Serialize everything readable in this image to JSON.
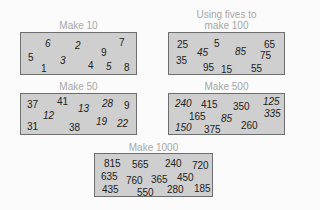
{
  "panels": [
    {
      "id": "make-10",
      "title": "Make 10",
      "numbers": [
        {
          "v": "6",
          "x": 24,
          "y": 5,
          "it": true
        },
        {
          "v": "2",
          "x": 54,
          "y": 7,
          "it": true
        },
        {
          "v": "7",
          "x": 98,
          "y": 4,
          "it": false
        },
        {
          "v": "5",
          "x": 7,
          "y": 19,
          "it": false
        },
        {
          "v": "9",
          "x": 80,
          "y": 14,
          "it": false
        },
        {
          "v": "3",
          "x": 39,
          "y": 22,
          "it": true
        },
        {
          "v": "1",
          "x": 20,
          "y": 30,
          "it": false
        },
        {
          "v": "4",
          "x": 67,
          "y": 27,
          "it": false
        },
        {
          "v": "5",
          "x": 85,
          "y": 28,
          "it": true
        },
        {
          "v": "8",
          "x": 103,
          "y": 29,
          "it": false
        }
      ]
    },
    {
      "id": "make-100",
      "title": "Using fives to make 100",
      "numbers": [
        {
          "v": "25",
          "x": 8,
          "y": 6,
          "it": false
        },
        {
          "v": "5",
          "x": 45,
          "y": 5,
          "it": false
        },
        {
          "v": "65",
          "x": 95,
          "y": 6,
          "it": false
        },
        {
          "v": "45",
          "x": 28,
          "y": 14,
          "it": true
        },
        {
          "v": "85",
          "x": 66,
          "y": 13,
          "it": true
        },
        {
          "v": "75",
          "x": 91,
          "y": 17,
          "it": false
        },
        {
          "v": "35",
          "x": 7,
          "y": 22,
          "it": false
        },
        {
          "v": "95",
          "x": 34,
          "y": 29,
          "it": false
        },
        {
          "v": "15",
          "x": 52,
          "y": 31,
          "it": false
        },
        {
          "v": "55",
          "x": 82,
          "y": 30,
          "it": false
        }
      ]
    },
    {
      "id": "make-50",
      "title": "Make 50",
      "numbers": [
        {
          "v": "37",
          "x": 6,
          "y": 5,
          "it": false
        },
        {
          "v": "41",
          "x": 36,
          "y": 2,
          "it": false
        },
        {
          "v": "13",
          "x": 57,
          "y": 9,
          "it": true
        },
        {
          "v": "28",
          "x": 81,
          "y": 4,
          "it": true
        },
        {
          "v": "9",
          "x": 103,
          "y": 6,
          "it": false
        },
        {
          "v": "12",
          "x": 22,
          "y": 16,
          "it": true
        },
        {
          "v": "19",
          "x": 75,
          "y": 22,
          "it": true
        },
        {
          "v": "22",
          "x": 96,
          "y": 24,
          "it": true
        },
        {
          "v": "31",
          "x": 6,
          "y": 27,
          "it": false
        },
        {
          "v": "38",
          "x": 48,
          "y": 28,
          "it": false
        }
      ]
    },
    {
      "id": "make-500",
      "title": "Make 500",
      "numbers": [
        {
          "v": "240",
          "x": 6,
          "y": 4,
          "it": true
        },
        {
          "v": "415",
          "x": 32,
          "y": 5,
          "it": false
        },
        {
          "v": "350",
          "x": 64,
          "y": 7,
          "it": false
        },
        {
          "v": "125",
          "x": 94,
          "y": 2,
          "it": true
        },
        {
          "v": "165",
          "x": 20,
          "y": 17,
          "it": false
        },
        {
          "v": "85",
          "x": 52,
          "y": 19,
          "it": true
        },
        {
          "v": "335",
          "x": 95,
          "y": 14,
          "it": true
        },
        {
          "v": "150",
          "x": 6,
          "y": 28,
          "it": true
        },
        {
          "v": "375",
          "x": 35,
          "y": 30,
          "it": false
        },
        {
          "v": "260",
          "x": 72,
          "y": 26,
          "it": false
        }
      ]
    },
    {
      "id": "make-1000",
      "title": "Make 1000",
      "numbers": [
        {
          "v": "815",
          "x": 9,
          "y": 4,
          "it": false
        },
        {
          "v": "565",
          "x": 37,
          "y": 5,
          "it": false
        },
        {
          "v": "240",
          "x": 70,
          "y": 4,
          "it": false
        },
        {
          "v": "720",
          "x": 97,
          "y": 6,
          "it": false
        },
        {
          "v": "635",
          "x": 6,
          "y": 17,
          "it": false
        },
        {
          "v": "760",
          "x": 31,
          "y": 21,
          "it": false
        },
        {
          "v": "365",
          "x": 56,
          "y": 20,
          "it": false
        },
        {
          "v": "450",
          "x": 82,
          "y": 18,
          "it": false
        },
        {
          "v": "435",
          "x": 7,
          "y": 30,
          "it": false
        },
        {
          "v": "550",
          "x": 42,
          "y": 33,
          "it": false
        },
        {
          "v": "280",
          "x": 72,
          "y": 30,
          "it": false
        },
        {
          "v": "185",
          "x": 99,
          "y": 29,
          "it": false
        }
      ]
    }
  ]
}
